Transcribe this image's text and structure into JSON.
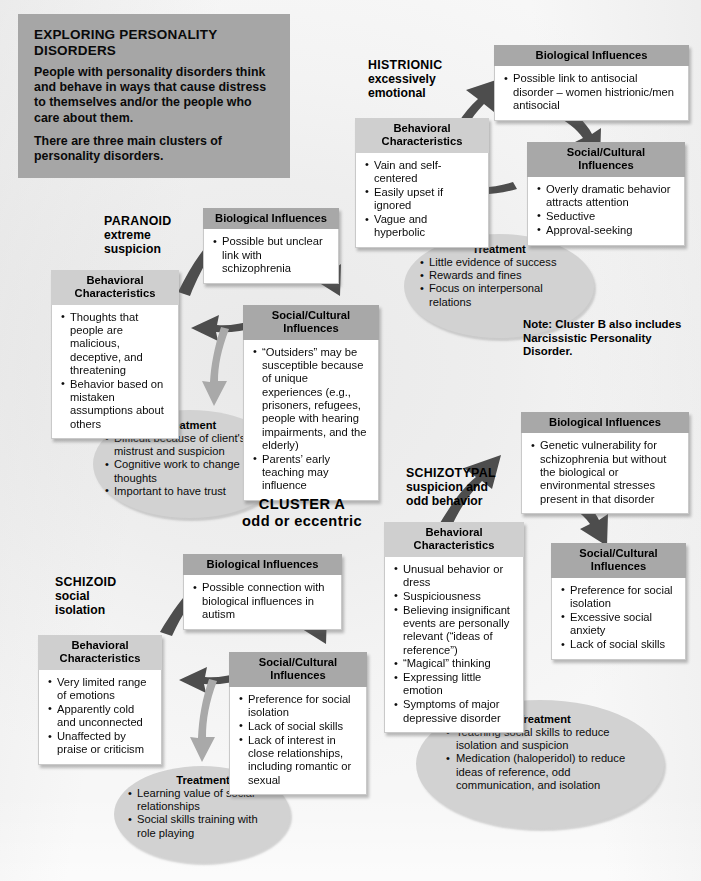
{
  "title_block": {
    "heading": "EXPLORING PERSONALITY DISORDERS",
    "paragraphs": [
      "People with personality disorders think and behave in ways that cause distress to themselves and/or the people who care about them.",
      "There are three main clusters of personality disorders."
    ]
  },
  "cluster_label": {
    "line1": "CLUSTER A",
    "line2": "odd or eccentric"
  },
  "note": "Note: Cluster B also includes Narcissistic Personality Disorder.",
  "headings": {
    "biological": "Biological Influences",
    "social": "Social/Cultural Influences",
    "social_l1": "Social/Cultural",
    "social_l2": "Influences",
    "behavioral_l1": "Behavioral",
    "behavioral_l2": "Characteristics",
    "treatment": "Treatment"
  },
  "disorders": {
    "histrionic": {
      "name": "HISTRIONIC",
      "desc_l1": "excessively",
      "desc_l2": "emotional",
      "biological": [
        "Possible link to antisocial disorder – women histrionic/men antisocial"
      ],
      "social": [
        "Overly dramatic behavior attracts attention",
        "Seductive",
        "Approval-seeking"
      ],
      "behavioral": [
        "Vain and self-centered",
        "Easily upset if ignored",
        "Vague and hyperbolic"
      ],
      "treatment": [
        "Little evidence of success",
        "Rewards and fines",
        "Focus on interpersonal relations"
      ]
    },
    "paranoid": {
      "name": "PARANOID",
      "desc_l1": "extreme",
      "desc_l2": "suspicion",
      "biological": [
        "Possible but unclear link with schizophrenia"
      ],
      "social": [
        "“Outsiders” may be susceptible because of unique experiences (e.g., prisoners, refugees, people with hearing impairments, and the elderly)",
        "Parents’ early teaching may influence"
      ],
      "behavioral": [
        "Thoughts that people are malicious, deceptive, and threatening",
        "Behavior based on mistaken assumptions about others"
      ],
      "treatment": [
        "Difficult because of client's mistrust and suspicion",
        "Cognitive work to change thoughts",
        "Important to have trust"
      ]
    },
    "schizoid": {
      "name": "SCHIZOID",
      "desc_l1": "social",
      "desc_l2": "isolation",
      "biological": [
        "Possible connection with biological influences in autism"
      ],
      "social": [
        "Preference for social isolation",
        "Lack of social skills",
        "Lack of interest in close relationships, including romantic or sexual"
      ],
      "behavioral": [
        "Very limited range of emotions",
        "Apparently cold and unconnected",
        "Unaffected by praise or criticism"
      ],
      "treatment": [
        "Learning value of social relationships",
        "Social skills training with role playing"
      ]
    },
    "schizotypal": {
      "name": "SCHIZOTYPAL",
      "desc_l1": "suspicion and",
      "desc_l2": "odd behavior",
      "biological": [
        "Genetic vulnerability for schizophrenia but without the biological or environmental stresses present in that disorder"
      ],
      "social": [
        "Preference for social isolation",
        "Excessive social anxiety",
        "Lack of social skills"
      ],
      "behavioral": [
        "Unusual behavior or dress",
        "Suspiciousness",
        "Believing insignificant events are personally relevant (“ideas of reference”)",
        "“Magical” thinking",
        "Expressing little emotion",
        "Symptoms of major depressive disorder"
      ],
      "treatment": [
        "Teaching social skills to reduce isolation and suspicion",
        "Medication (haloperidol) to reduce ideas of reference, odd communication, and isolation"
      ]
    }
  },
  "colors": {
    "header_gray": "#a8a8a8",
    "title_gray": "#a6a6a6",
    "ellipse_gray": "#d2d2d2",
    "page_bg": "#f1f1f1",
    "arrow_dark": "#4d4d4d",
    "arrow_light": "#a9a9a9"
  }
}
